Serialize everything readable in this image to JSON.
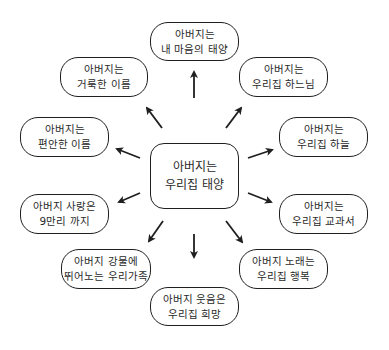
{
  "diagram": {
    "type": "mind-map",
    "colors": {
      "stroke": "#1f1f1f",
      "text": "#2a2a2a",
      "background": "#ffffff"
    },
    "center": {
      "line1": "아버지는",
      "line2": "우리집 태양"
    },
    "nodes": [
      {
        "id": "top",
        "line1": "아버지는",
        "line2": "내 마음의 태양"
      },
      {
        "id": "top-left",
        "line1": "아버지는",
        "line2": "거룩한 이름"
      },
      {
        "id": "top-right",
        "line1": "아버지는",
        "line2": "우리집 하느님"
      },
      {
        "id": "left",
        "line1": "아버지는",
        "line2": "편안한 이름"
      },
      {
        "id": "right",
        "line1": "아버지는",
        "line2": "우리집 하늘"
      },
      {
        "id": "left-lower",
        "line1": "아버지 사랑은",
        "line2": "9만리 까지"
      },
      {
        "id": "right-lower",
        "line1": "아버지는",
        "line2": "우리집 교과서"
      },
      {
        "id": "bottom-left",
        "line1": "아버지 강물에",
        "line2": "뛰어노는 우리가족"
      },
      {
        "id": "bottom-right",
        "line1": "아버지 노래는",
        "line2": "우리집 행복"
      },
      {
        "id": "bottom",
        "line1": "아버지 웃음은",
        "line2": "우리집 희망"
      }
    ],
    "edges": [
      {
        "from": "center",
        "to": "top"
      },
      {
        "from": "center",
        "to": "top-left"
      },
      {
        "from": "center",
        "to": "top-right"
      },
      {
        "from": "center",
        "to": "left"
      },
      {
        "from": "center",
        "to": "right"
      },
      {
        "from": "center",
        "to": "left-lower"
      },
      {
        "from": "center",
        "to": "right-lower"
      },
      {
        "from": "center",
        "to": "bottom-left"
      },
      {
        "from": "center",
        "to": "bottom-right"
      },
      {
        "from": "center",
        "to": "bottom"
      }
    ]
  }
}
